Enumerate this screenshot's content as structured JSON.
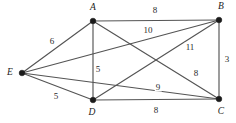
{
  "figure": {
    "title": "",
    "background_color": "#ffffff",
    "edge_color": "#545454",
    "vertex_color": "#1b1b1b",
    "label_color": "#1b1b1b"
  },
  "chart_data": {
    "type": "diagram",
    "subtype": "weighted-undirected-graph",
    "title": "",
    "xlabel": "",
    "ylabel": "",
    "grid": false,
    "legend": false,
    "nodes": [
      {
        "id": "A",
        "label": "A",
        "x": 93,
        "y": 21,
        "label_x": 93,
        "label_y": 8
      },
      {
        "id": "B",
        "label": "B",
        "x": 219,
        "y": 20,
        "label_x": 221,
        "label_y": 7
      },
      {
        "id": "C",
        "label": "C",
        "x": 219,
        "y": 99,
        "label_x": 221,
        "label_y": 112
      },
      {
        "id": "D",
        "label": "D",
        "x": 93,
        "y": 100,
        "label_x": 92,
        "label_y": 113
      },
      {
        "id": "E",
        "label": "E",
        "x": 22,
        "y": 73,
        "label_x": 10,
        "label_y": 73
      }
    ],
    "edges": [
      {
        "source": "A",
        "target": "B",
        "weight": 8,
        "label": "8",
        "label_x": 155,
        "label_y": 10
      },
      {
        "source": "A",
        "target": "D",
        "weight": 5,
        "label": "5",
        "label_x": 98,
        "label_y": 69
      },
      {
        "source": "A",
        "target": "C",
        "weight": 8,
        "label": "8",
        "label_x": 196,
        "label_y": 73
      },
      {
        "source": "A",
        "target": "E",
        "weight": 6,
        "label": "6",
        "label_x": 52,
        "label_y": 41
      },
      {
        "source": "B",
        "target": "C",
        "weight": 3,
        "label": "3",
        "label_x": 227,
        "label_y": 59
      },
      {
        "source": "B",
        "target": "D",
        "weight": 11,
        "label": "11",
        "label_x": 190,
        "label_y": 47
      },
      {
        "source": "B",
        "target": "E",
        "weight": 10,
        "label": "10",
        "label_x": 148,
        "label_y": 30
      },
      {
        "source": "C",
        "target": "D",
        "weight": 8,
        "label": "8",
        "label_x": 156,
        "label_y": 110
      },
      {
        "source": "C",
        "target": "E",
        "weight": 9,
        "label": "9",
        "label_x": 158,
        "label_y": 87
      },
      {
        "source": "D",
        "target": "E",
        "weight": 5,
        "label": "5",
        "label_x": 56,
        "label_y": 96
      }
    ]
  }
}
